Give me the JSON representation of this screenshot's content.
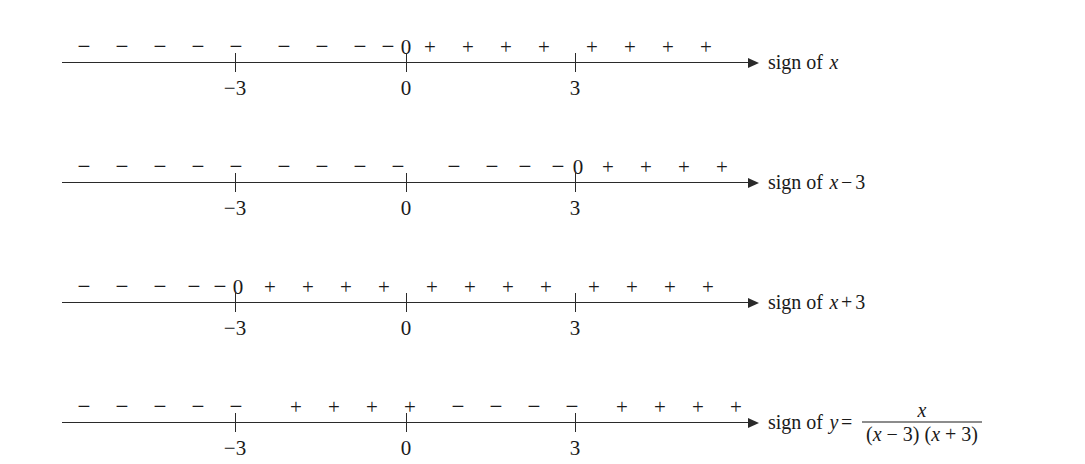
{
  "figure": {
    "type": "sign-charts",
    "axis": {
      "tick_values": [
        "−3",
        "0",
        "3"
      ],
      "tick_positions_px": [
        173,
        344,
        513
      ],
      "axis_left_px": 62,
      "axis_width_px": 688,
      "arrow_direction": "right"
    },
    "lines": [
      {
        "id": "sign-of-x",
        "label": {
          "lead": "sign of",
          "expr_parts": [
            {
              "text": "x",
              "style": "italic"
            }
          ]
        },
        "signs": [
          {
            "symbol": "−",
            "x": 22
          },
          {
            "symbol": "−",
            "x": 60
          },
          {
            "symbol": "−",
            "x": 98
          },
          {
            "symbol": "−",
            "x": 136
          },
          {
            "symbol": "−",
            "x": 174
          },
          {
            "symbol": "−",
            "x": 222
          },
          {
            "symbol": "−",
            "x": 260
          },
          {
            "symbol": "−",
            "x": 298
          },
          {
            "symbol": "−",
            "x": 326
          },
          {
            "symbol": "0",
            "x": 344
          },
          {
            "symbol": "+",
            "x": 368
          },
          {
            "symbol": "+",
            "x": 406
          },
          {
            "symbol": "+",
            "x": 444
          },
          {
            "symbol": "+",
            "x": 482
          },
          {
            "symbol": "+",
            "x": 530
          },
          {
            "symbol": "+",
            "x": 568
          },
          {
            "symbol": "+",
            "x": 606
          },
          {
            "symbol": "+",
            "x": 644
          }
        ]
      },
      {
        "id": "sign-of-x-minus-3",
        "label": {
          "lead": "sign of",
          "expr_parts": [
            {
              "text": "x",
              "style": "italic"
            },
            {
              "text": "−",
              "style": "op"
            },
            {
              "text": "3",
              "style": "roman"
            }
          ]
        },
        "signs": [
          {
            "symbol": "−",
            "x": 22
          },
          {
            "symbol": "−",
            "x": 60
          },
          {
            "symbol": "−",
            "x": 98
          },
          {
            "symbol": "−",
            "x": 136
          },
          {
            "symbol": "−",
            "x": 174
          },
          {
            "symbol": "−",
            "x": 222
          },
          {
            "symbol": "−",
            "x": 260
          },
          {
            "symbol": "−",
            "x": 298
          },
          {
            "symbol": "−",
            "x": 336
          },
          {
            "symbol": "−",
            "x": 392
          },
          {
            "symbol": "−",
            "x": 430
          },
          {
            "symbol": "−",
            "x": 463
          },
          {
            "symbol": "−",
            "x": 496
          },
          {
            "symbol": "0",
            "x": 516
          },
          {
            "symbol": "+",
            "x": 546
          },
          {
            "symbol": "+",
            "x": 584
          },
          {
            "symbol": "+",
            "x": 622
          },
          {
            "symbol": "+",
            "x": 660
          }
        ]
      },
      {
        "id": "sign-of-x-plus-3",
        "label": {
          "lead": "sign of",
          "expr_parts": [
            {
              "text": "x",
              "style": "italic"
            },
            {
              "text": "+",
              "style": "op"
            },
            {
              "text": "3",
              "style": "roman"
            }
          ]
        },
        "signs": [
          {
            "symbol": "−",
            "x": 22
          },
          {
            "symbol": "−",
            "x": 60
          },
          {
            "symbol": "−",
            "x": 98
          },
          {
            "symbol": "−",
            "x": 132
          },
          {
            "symbol": "−",
            "x": 158
          },
          {
            "symbol": "0",
            "x": 176
          },
          {
            "symbol": "+",
            "x": 208
          },
          {
            "symbol": "+",
            "x": 246
          },
          {
            "symbol": "+",
            "x": 284
          },
          {
            "symbol": "+",
            "x": 322
          },
          {
            "symbol": "+",
            "x": 370
          },
          {
            "symbol": "+",
            "x": 408
          },
          {
            "symbol": "+",
            "x": 446
          },
          {
            "symbol": "+",
            "x": 484
          },
          {
            "symbol": "+",
            "x": 532
          },
          {
            "symbol": "+",
            "x": 570
          },
          {
            "symbol": "+",
            "x": 608
          },
          {
            "symbol": "+",
            "x": 646
          }
        ]
      },
      {
        "id": "sign-of-y",
        "label": {
          "lead": "sign of",
          "expr_parts": [
            {
              "text": "y",
              "style": "italic"
            },
            {
              "text": "=",
              "style": "op"
            }
          ],
          "fraction": {
            "numerator": "x",
            "denominator": "(x − 3) (x + 3)"
          }
        },
        "signs": [
          {
            "symbol": "−",
            "x": 22
          },
          {
            "symbol": "−",
            "x": 60
          },
          {
            "symbol": "−",
            "x": 98
          },
          {
            "symbol": "−",
            "x": 136
          },
          {
            "symbol": "−",
            "x": 174
          },
          {
            "symbol": "+",
            "x": 234
          },
          {
            "symbol": "+",
            "x": 272
          },
          {
            "symbol": "+",
            "x": 310
          },
          {
            "symbol": "+",
            "x": 348
          },
          {
            "symbol": "−",
            "x": 396
          },
          {
            "symbol": "−",
            "x": 434
          },
          {
            "symbol": "−",
            "x": 472
          },
          {
            "symbol": "−",
            "x": 510
          },
          {
            "symbol": "+",
            "x": 560
          },
          {
            "symbol": "+",
            "x": 598
          },
          {
            "symbol": "+",
            "x": 636
          },
          {
            "symbol": "+",
            "x": 674
          }
        ]
      }
    ]
  },
  "chart_data": {
    "type": "table",
    "xlabel": "",
    "ylabel": "",
    "axis_ticks": [
      "−3",
      "0",
      "3"
    ],
    "intervals": [
      "x < −3",
      "−3 < x < 0",
      "0 < x < 3",
      "x > 3"
    ],
    "series": [
      {
        "name": "sign of x",
        "values": [
          "−",
          "−",
          "+",
          "+"
        ],
        "zero_at": "0"
      },
      {
        "name": "sign of x − 3",
        "values": [
          "−",
          "−",
          "−",
          "+"
        ],
        "zero_at": "3"
      },
      {
        "name": "sign of x + 3",
        "values": [
          "−",
          "+",
          "+",
          "+"
        ],
        "zero_at": "−3"
      },
      {
        "name": "sign of y = x/((x − 3)(x + 3))",
        "values": [
          "−",
          "+",
          "−",
          "+"
        ],
        "zero_at": "0"
      }
    ]
  }
}
